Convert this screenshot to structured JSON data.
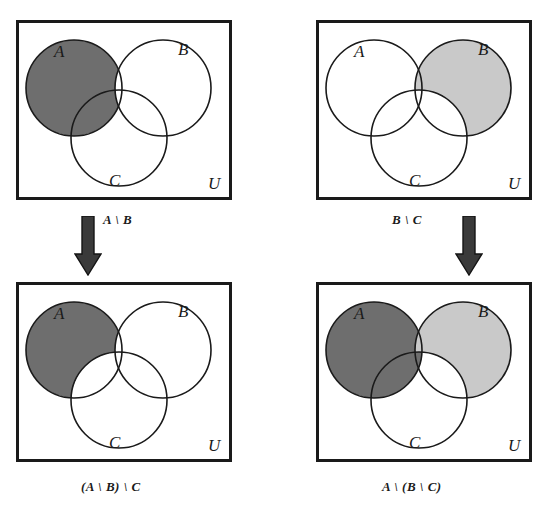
{
  "figure": {
    "colors": {
      "background": "#ffffff",
      "outline": "#1a1a1a",
      "box_border": "#1a1a1a",
      "shade_dark": "#6e6e6e",
      "shade_light": "#c9c9c9",
      "shade_none": "#ffffff",
      "arrow_fill": "#3a3a3a",
      "label_text": "#1a1a1a"
    },
    "geometry": {
      "box_width": 216,
      "box_height": 180,
      "box_border_width": 3,
      "circle_radius": 48,
      "circle_a_center": [
        58,
        68
      ],
      "circle_b_center": [
        147,
        68
      ],
      "circle_c_center": [
        103,
        118
      ]
    }
  },
  "panels": [
    {
      "id": "top-left",
      "name": "panel-a-minus-b",
      "caption": "A \\ B",
      "universe_label": "U",
      "circle_labels": {
        "a": "A",
        "b": "B",
        "c": "C"
      },
      "shading": {
        "a_only": "dark",
        "b_only": "none",
        "c_only": "none",
        "a_and_b_not_c": "none",
        "a_and_c_not_b": "dark",
        "b_and_c_not_a": "none",
        "a_and_b_and_c": "none",
        "outside": "none"
      }
    },
    {
      "id": "top-right",
      "name": "panel-b-minus-c",
      "caption": "B \\ C",
      "universe_label": "U",
      "circle_labels": {
        "a": "A",
        "b": "B",
        "c": "C"
      },
      "shading": {
        "a_only": "none",
        "b_only": "light",
        "c_only": "none",
        "a_and_b_not_c": "light",
        "a_and_c_not_b": "none",
        "b_and_c_not_a": "none",
        "a_and_b_and_c": "none",
        "outside": "none"
      }
    },
    {
      "id": "bottom-left",
      "name": "panel-a-minus-b-minus-c",
      "caption": "(A \\ B) \\ C",
      "universe_label": "U",
      "circle_labels": {
        "a": "A",
        "b": "B",
        "c": "C"
      },
      "shading": {
        "a_only": "dark",
        "b_only": "none",
        "c_only": "none",
        "a_and_b_not_c": "none",
        "a_and_c_not_b": "none",
        "b_and_c_not_a": "none",
        "a_and_b_and_c": "none",
        "outside": "none"
      }
    },
    {
      "id": "bottom-right",
      "name": "panel-a-minus-bracket-b-minus-c",
      "caption": "A \\ (B \\ C)",
      "universe_label": "U",
      "circle_labels": {
        "a": "A",
        "b": "B",
        "c": "C"
      },
      "shading": {
        "a_only": "dark",
        "b_only": "light",
        "c_only": "none",
        "a_and_b_not_c": "light",
        "a_and_c_not_b": "dark",
        "b_and_c_not_a": "none",
        "a_and_b_and_c": "dark",
        "outside": "none"
      }
    }
  ],
  "arrows": [
    {
      "id": "arrow-left",
      "name": "down-arrow-left",
      "direction": "down"
    },
    {
      "id": "arrow-right",
      "name": "down-arrow-right",
      "direction": "down"
    }
  ]
}
